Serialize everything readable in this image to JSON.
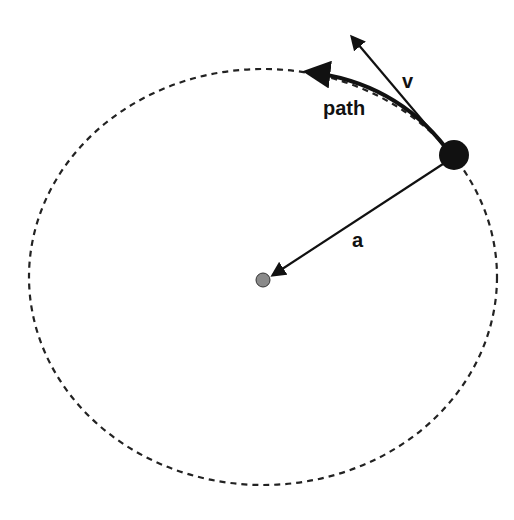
{
  "diagram": {
    "labels": {
      "velocity": "v",
      "path": "path",
      "acceleration": "a"
    },
    "colors": {
      "line": "#111111",
      "object": "#111111",
      "center": "#8a8a8a",
      "background": "#ffffff"
    },
    "orbit": {
      "style": "dashed",
      "cx": 263,
      "cy": 277,
      "rx": 234,
      "ry": 208
    },
    "object": {
      "x": 454,
      "y": 155,
      "r": 15
    },
    "center": {
      "x": 263,
      "y": 280,
      "r": 7
    }
  }
}
